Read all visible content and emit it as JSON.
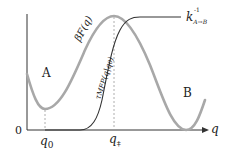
{
  "diagram": {
    "type": "energy-landscape",
    "axis": {
      "x_label": "q",
      "y_origin_label": "0"
    },
    "curves": {
      "free_energy": {
        "label": "βF(q)",
        "color": "#a8a8a8"
      },
      "mfpt": {
        "label": "τMFP(q|q0)",
        "label_prefix": "τ",
        "label_sub": "MFP",
        "label_arg": "(q|q",
        "label_arg_sub": "0",
        "label_close": ")",
        "color": "#333333"
      }
    },
    "states": {
      "a": "A",
      "b": "B"
    },
    "ticks": {
      "q0_main": "q",
      "q0_sub": "0",
      "qts_main": "q",
      "qts_sub": "‡"
    },
    "rate_label": {
      "main": "k",
      "sup": "-1",
      "sub": "A→B"
    },
    "colors": {
      "axis": "#333333",
      "free_energy": "#a8a8a8",
      "mfpt": "#333333",
      "dashed": "#999999"
    }
  }
}
